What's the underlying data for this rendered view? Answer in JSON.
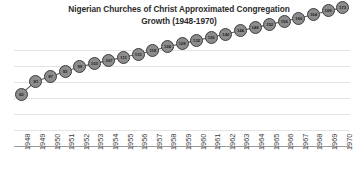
{
  "chart_data": {
    "type": "line",
    "title": "Nigerian Churches of Christ Approximated Congregation Growth (1948-1970)",
    "title_line1": "Nigerian Churches of Christ Approximated Congregation",
    "title_line2": "Growth (1948-1970)",
    "xlabel": "",
    "ylabel": "",
    "grid": true,
    "gridlines_count": 6,
    "legend": false,
    "legend_position": "none",
    "y_axis_tick_labels": false,
    "ylim": [
      0,
      140
    ],
    "marker": "circle",
    "data_labels_shown": true,
    "categories": [
      "1948",
      "1949",
      "1950",
      "1951",
      "1952",
      "1953",
      "1954",
      "1955",
      "1956",
      "1957",
      "1958",
      "1959",
      "1960",
      "1961",
      "1962",
      "1963",
      "1964",
      "1965",
      "1966",
      "1967",
      "1968",
      "1969",
      "1970"
    ],
    "values": [
      65,
      81,
      87,
      93,
      99,
      103,
      107,
      111,
      115,
      119,
      124,
      128,
      132,
      136,
      140,
      144,
      148,
      152,
      156,
      160,
      164,
      169,
      173
    ],
    "series": [
      {
        "name": "Congregations",
        "values": [
          65,
          81,
          87,
          93,
          99,
          103,
          107,
          111,
          115,
          119,
          124,
          128,
          132,
          136,
          140,
          144,
          148,
          152,
          156,
          160,
          164,
          169,
          173
        ]
      }
    ],
    "colors": {
      "marker_fill": "#8c8c8c",
      "marker_border": "#3d3d3d",
      "line": "#5a5a5a",
      "gridline": "#e4e4e4",
      "axis": "#9a9a9a",
      "title_text": "#2b2b2b",
      "tick_text": "#3a3a3a",
      "background": "#ffffff"
    }
  }
}
